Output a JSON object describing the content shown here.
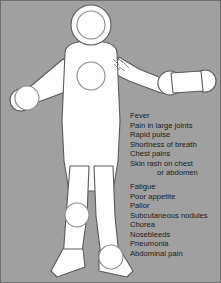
{
  "panel": {
    "background_color": "#a0a0a0",
    "border_color": "#6e6e6e",
    "figure_fill_color": "#fdfdfd",
    "figure_outline_color": "#5a5a5a",
    "text_color": "#1a1a1a"
  },
  "figure": {
    "name": "human-body-outline",
    "parts": [
      {
        "name": "head",
        "label": "head"
      },
      {
        "name": "head-inner-circle",
        "label": "head outline"
      },
      {
        "name": "torso",
        "label": "torso"
      },
      {
        "name": "chest-circle",
        "label": "chest"
      },
      {
        "name": "left-arm",
        "label": "left arm"
      },
      {
        "name": "right-arm",
        "label": "right arm"
      },
      {
        "name": "left-elbow-joint",
        "label": "left elbow"
      },
      {
        "name": "right-elbow-joint",
        "label": "right elbow"
      },
      {
        "name": "left-hand",
        "label": "left hand"
      },
      {
        "name": "right-hand",
        "label": "right hand"
      },
      {
        "name": "left-leg",
        "label": "left leg"
      },
      {
        "name": "right-leg",
        "label": "right leg"
      },
      {
        "name": "left-knee-joint",
        "label": "left knee"
      },
      {
        "name": "right-knee-joint",
        "label": "right knee"
      },
      {
        "name": "left-foot",
        "label": "left foot"
      },
      {
        "name": "right-foot",
        "label": "right foot"
      },
      {
        "name": "shoulder-rash-marking",
        "label": "skin rash marking on shoulder"
      }
    ]
  },
  "symptoms": {
    "items": [
      {
        "text": "Fever",
        "continuation": false,
        "group_gap": false
      },
      {
        "text": "Pain in large joints",
        "continuation": false,
        "group_gap": false
      },
      {
        "text": "Rapid pulse",
        "continuation": false,
        "group_gap": false
      },
      {
        "text": "Shortness of breath",
        "continuation": false,
        "group_gap": false
      },
      {
        "text": "Chest pains",
        "continuation": false,
        "group_gap": false
      },
      {
        "text": "Skin rash on chest",
        "continuation": false,
        "group_gap": false
      },
      {
        "text": "or abdomen",
        "continuation": true,
        "group_gap": false
      },
      {
        "text": "Fatigue",
        "continuation": false,
        "group_gap": true
      },
      {
        "text": "Poor appetite",
        "continuation": false,
        "group_gap": false
      },
      {
        "text": "Pallor",
        "continuation": false,
        "group_gap": false
      },
      {
        "text": "Subcutaneous nodules",
        "continuation": false,
        "group_gap": false
      },
      {
        "text": "Chorea",
        "continuation": false,
        "group_gap": false
      },
      {
        "text": "Nosebleeds",
        "continuation": false,
        "group_gap": false
      },
      {
        "text": "Pneumonia",
        "continuation": false,
        "group_gap": false
      },
      {
        "text": "Abdominal pain",
        "continuation": false,
        "group_gap": false
      }
    ]
  }
}
